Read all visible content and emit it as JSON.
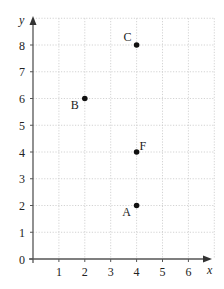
{
  "chart_data": {
    "type": "scatter",
    "title": "",
    "xlabel": "x",
    "ylabel": "y",
    "xlim": [
      0,
      7
    ],
    "ylim": [
      0,
      9
    ],
    "grid": true,
    "x_ticks": [
      "1",
      "2",
      "3",
      "4",
      "5",
      "6"
    ],
    "y_ticks": [
      "0",
      "1",
      "2",
      "3",
      "4",
      "5",
      "6",
      "7",
      "8"
    ],
    "points": [
      {
        "label": "A",
        "x": 4,
        "y": 2,
        "label_pos": "below-left"
      },
      {
        "label": "B",
        "x": 2,
        "y": 6,
        "label_pos": "below-left"
      },
      {
        "label": "C",
        "x": 4,
        "y": 8,
        "label_pos": "above-left"
      },
      {
        "label": "F",
        "x": 4,
        "y": 4,
        "label_pos": "above-right"
      }
    ]
  },
  "colors": {
    "point": "#111111",
    "axis": "#555555",
    "grid": "#c8c8c8"
  }
}
